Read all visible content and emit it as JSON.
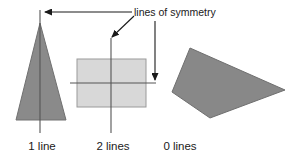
{
  "figure": {
    "name": "lines-of-symmetry-figure",
    "background_color": "#ffffff",
    "annotation": {
      "text": "lines of symmetry",
      "color": "#1a1a1a"
    },
    "shapes": [
      {
        "id": "triangle",
        "label": "1 line",
        "symmetry_lines": 1,
        "fill_color": "#8a8a8a",
        "stroke_color": "#707070",
        "points": "40,23 16,120 66,120"
      },
      {
        "id": "rectangle",
        "label": "2 lines",
        "symmetry_lines": 2,
        "fill_color": "#d8d8d8",
        "stroke_color": "#9a9a9a",
        "x": 77,
        "y": 59,
        "width": 69,
        "height": 48
      },
      {
        "id": "quadrilateral",
        "label": "0 lines",
        "symmetry_lines": 0,
        "fill_color": "#888888",
        "stroke_color": "#6f6f6f",
        "points": "190,48 285,90 210,118 172,92"
      }
    ],
    "symmetry_line_color": "#555555",
    "arrow_color": "#1a1a1a",
    "labels": [
      {
        "text": "1 line",
        "x": 42,
        "y": 150
      },
      {
        "text": "2 lines",
        "x": 113,
        "y": 150
      },
      {
        "text": "0 lines",
        "x": 180,
        "y": 150
      }
    ]
  }
}
